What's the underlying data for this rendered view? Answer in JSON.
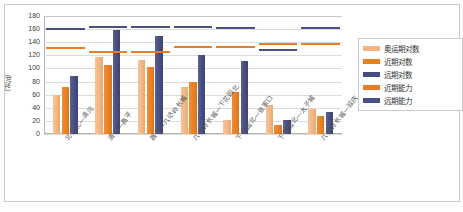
{
  "chart_data": {
    "type": "bar",
    "title": "",
    "xlabel": "",
    "ylabel": "（对/d）",
    "ylim": [
      0,
      180
    ],
    "yticks": [
      180,
      160,
      140,
      120,
      100,
      80,
      60,
      40,
      20,
      0
    ],
    "grid": true,
    "legend_position": "right",
    "categories": [
      "北京北—清河",
      "清河—昌平",
      "昌平—八达岭长城",
      "八达岭长城—下花园北",
      "下花园北—张家口",
      "下花园北—太子城",
      "八达岭长城—延庆"
    ],
    "series": [
      {
        "name": "奥运期对数",
        "type": "bar",
        "color": "#f3b582",
        "values": [
          60,
          117,
          113,
          72,
          22,
          44,
          38
        ]
      },
      {
        "name": "近期对数",
        "type": "bar",
        "color": "#e8801f",
        "values": [
          72,
          106,
          102,
          79,
          64,
          14,
          28
        ]
      },
      {
        "name": "远期对数",
        "type": "bar",
        "color": "#474c80",
        "values": [
          88,
          158,
          150,
          120,
          112,
          22,
          34
        ]
      },
      {
        "name": "近期能力",
        "type": "step-line",
        "color": "#e87d26",
        "values": [
          131,
          125,
          125,
          133,
          133,
          137,
          137
        ]
      },
      {
        "name": "远期能力",
        "type": "step-line",
        "color": "#4a5085",
        "values": [
          160,
          163,
          163,
          163,
          161,
          128,
          161
        ]
      }
    ]
  },
  "legend": {
    "items": [
      {
        "label": "奥运期对数",
        "color": "#f3b582"
      },
      {
        "label": "近期对数",
        "color": "#e8801f"
      },
      {
        "label": "远期对数",
        "color": "#474c80"
      },
      {
        "label": "近期能力",
        "color": "#e87d26"
      },
      {
        "label": "远期能力",
        "color": "#4a5085"
      }
    ]
  }
}
